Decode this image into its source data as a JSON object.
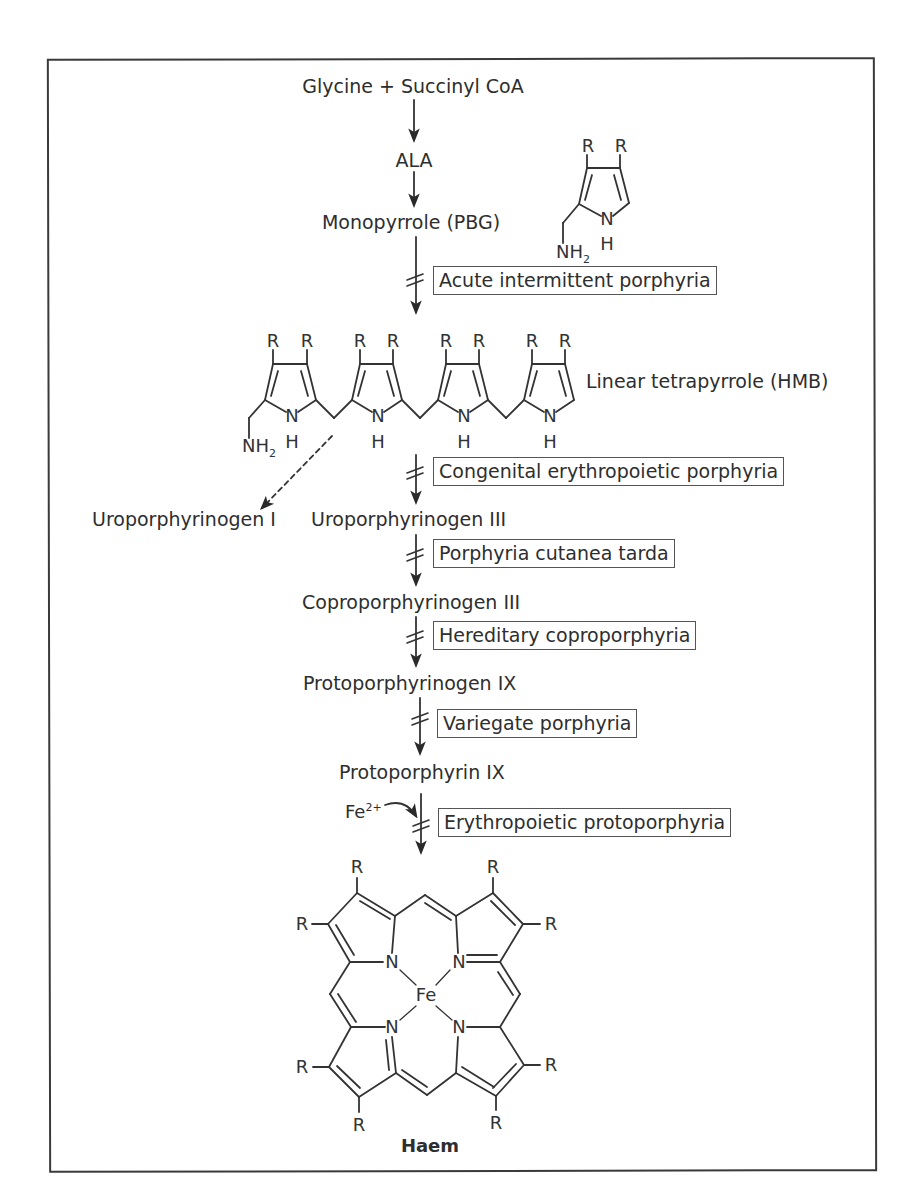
{
  "pathway": {
    "steps": [
      {
        "label": "Glycine + Succinyl CoA"
      },
      {
        "label": "ALA"
      },
      {
        "label": "Monopyrrole (PBG)"
      },
      {
        "label": "Linear tetrapyrrole (HMB)"
      },
      {
        "label": "Uroporphyrinogen III"
      },
      {
        "label": "Coproporphyrinogen III"
      },
      {
        "label": "Protoporphyrinogen IX"
      },
      {
        "label": "Protoporphyrin IX"
      },
      {
        "label": "Haem"
      }
    ],
    "side_product": {
      "label": "Uroporphyrinogen I"
    },
    "cofactor": {
      "symbol": "Fe",
      "charge": "2+"
    }
  },
  "disorders": [
    {
      "label": "Acute intermittent porphyria"
    },
    {
      "label": "Congenital erythropoietic porphyria"
    },
    {
      "label": "Porphyria cutanea tarda"
    },
    {
      "label": "Hereditary coproporphyria"
    },
    {
      "label": "Variegate porphyria"
    },
    {
      "label": "Erythropoietic protoporphyria"
    }
  ],
  "atoms": {
    "R": "R",
    "N": "N",
    "H": "H",
    "NH": "NH",
    "sub2": "2",
    "Fe": "Fe"
  },
  "icons": {
    "pathway_arrow": "down-arrow-icon",
    "block_mark": "enzyme-block-icon",
    "dashed_arrow": "dashed-arrow-icon",
    "curved_arrow": "curved-arrow-icon"
  }
}
